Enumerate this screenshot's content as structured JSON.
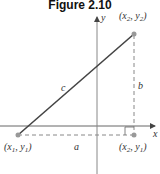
{
  "title": "Figure 2.10",
  "axes": {
    "x_label": "x",
    "y_label": "y"
  },
  "points": {
    "p1": {
      "label": "(x1, y1)",
      "name": "x",
      "sub1": "1",
      "name2": "y",
      "sub2": "1"
    },
    "p2": {
      "label": "(x2, y2)",
      "name": "x",
      "sub1": "2",
      "name2": "y",
      "sub2": "2"
    },
    "p3": {
      "label": "(x2, y1)",
      "name": "x",
      "sub1": "2",
      "name2": "y",
      "sub2": "1"
    }
  },
  "sides": {
    "hypotenuse": "c",
    "vertical": "b",
    "horizontal": "a"
  },
  "colors": {
    "line": "#444444",
    "point": "#999999",
    "axis": "#555555"
  }
}
